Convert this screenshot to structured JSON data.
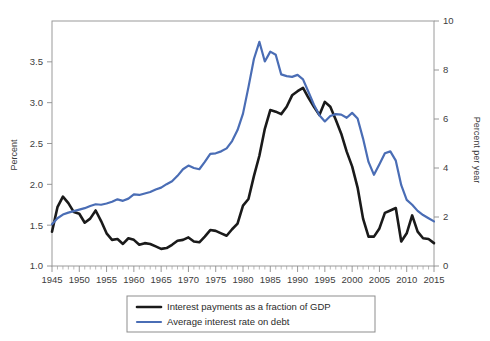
{
  "chart_data": {
    "type": "line",
    "title": "",
    "xlabel": "",
    "ylabel": "Percent",
    "y2label": "Percent per year",
    "xlim": [
      1945,
      2015
    ],
    "ylim": [
      1.0,
      4.0
    ],
    "y2lim": [
      0,
      10
    ],
    "grid": false,
    "legend_position": "below-center",
    "x_ticks": [
      1945,
      1950,
      1955,
      1960,
      1965,
      1970,
      1975,
      1980,
      1985,
      1990,
      1995,
      2000,
      2005,
      2010,
      2015
    ],
    "x_tick_labels": [
      "1945",
      "1950",
      "1955",
      "1960",
      "1965",
      "1970",
      "1975",
      "1980",
      "1985",
      "1990",
      "1995",
      "2000",
      "2005",
      "2010",
      "2015"
    ],
    "x_minor_tick_interval": 1,
    "y_ticks": [
      1.0,
      1.5,
      2.0,
      2.5,
      3.0,
      3.5
    ],
    "y_tick_labels": [
      "1.0",
      "1.5",
      "2.0",
      "2.5",
      "3.0",
      "3.5"
    ],
    "y2_ticks": [
      0,
      2,
      4,
      6,
      8,
      10
    ],
    "y2_tick_labels": [
      "0",
      "2",
      "4",
      "6",
      "8",
      "10"
    ],
    "x": [
      1945,
      1946,
      1947,
      1948,
      1949,
      1950,
      1951,
      1952,
      1953,
      1954,
      1955,
      1956,
      1957,
      1958,
      1959,
      1960,
      1961,
      1962,
      1963,
      1964,
      1965,
      1966,
      1967,
      1968,
      1969,
      1970,
      1971,
      1972,
      1973,
      1974,
      1975,
      1976,
      1977,
      1978,
      1979,
      1980,
      1981,
      1982,
      1983,
      1984,
      1985,
      1986,
      1987,
      1988,
      1989,
      1990,
      1991,
      1992,
      1993,
      1994,
      1995,
      1996,
      1997,
      1998,
      1999,
      2000,
      2001,
      2002,
      2003,
      2004,
      2005,
      2006,
      2007,
      2008,
      2009,
      2010,
      2011,
      2012,
      2013,
      2014,
      2015
    ],
    "series": [
      {
        "name": "Interest payments as a fraction of GDP",
        "axis": "left",
        "color": "#1a1a1a",
        "units": "Percent of GDP",
        "values": [
          1.42,
          1.72,
          1.85,
          1.77,
          1.66,
          1.64,
          1.53,
          1.58,
          1.68,
          1.55,
          1.4,
          1.32,
          1.33,
          1.27,
          1.34,
          1.32,
          1.26,
          1.28,
          1.27,
          1.24,
          1.21,
          1.22,
          1.26,
          1.31,
          1.32,
          1.35,
          1.3,
          1.29,
          1.36,
          1.44,
          1.43,
          1.4,
          1.37,
          1.45,
          1.52,
          1.74,
          1.82,
          2.1,
          2.35,
          2.68,
          2.91,
          2.89,
          2.86,
          2.95,
          3.09,
          3.14,
          3.18,
          3.06,
          2.95,
          2.85,
          3.01,
          2.95,
          2.79,
          2.62,
          2.4,
          2.22,
          1.96,
          1.58,
          1.36,
          1.36,
          1.46,
          1.65,
          1.68,
          1.71,
          1.3,
          1.4,
          1.62,
          1.42,
          1.34,
          1.33,
          1.28
        ]
      },
      {
        "name": "Average interest rate on debt",
        "axis": "right",
        "color": "#4a6db5",
        "units": "Percent per year",
        "values": [
          1.7,
          1.95,
          2.1,
          2.18,
          2.24,
          2.3,
          2.36,
          2.45,
          2.52,
          2.5,
          2.55,
          2.62,
          2.72,
          2.66,
          2.75,
          2.92,
          2.9,
          2.96,
          3.02,
          3.12,
          3.2,
          3.34,
          3.46,
          3.68,
          3.95,
          4.1,
          4.0,
          3.95,
          4.25,
          4.58,
          4.6,
          4.68,
          4.8,
          5.1,
          5.55,
          6.22,
          7.3,
          8.45,
          9.15,
          8.35,
          8.75,
          8.62,
          7.82,
          7.75,
          7.72,
          7.8,
          7.62,
          7.1,
          6.58,
          6.15,
          5.9,
          6.12,
          6.2,
          6.18,
          6.05,
          6.25,
          6.02,
          5.2,
          4.25,
          3.72,
          4.15,
          4.6,
          4.68,
          4.3,
          3.3,
          2.7,
          2.5,
          2.25,
          2.08,
          1.95,
          1.82
        ]
      }
    ],
    "legend_entries": [
      {
        "label": "Interest payments as a fraction of GDP",
        "color": "#1a1a1a",
        "width": 2.6
      },
      {
        "label": "Average interest rate on debt",
        "color": "#4a6db5",
        "width": 2.2
      }
    ]
  }
}
